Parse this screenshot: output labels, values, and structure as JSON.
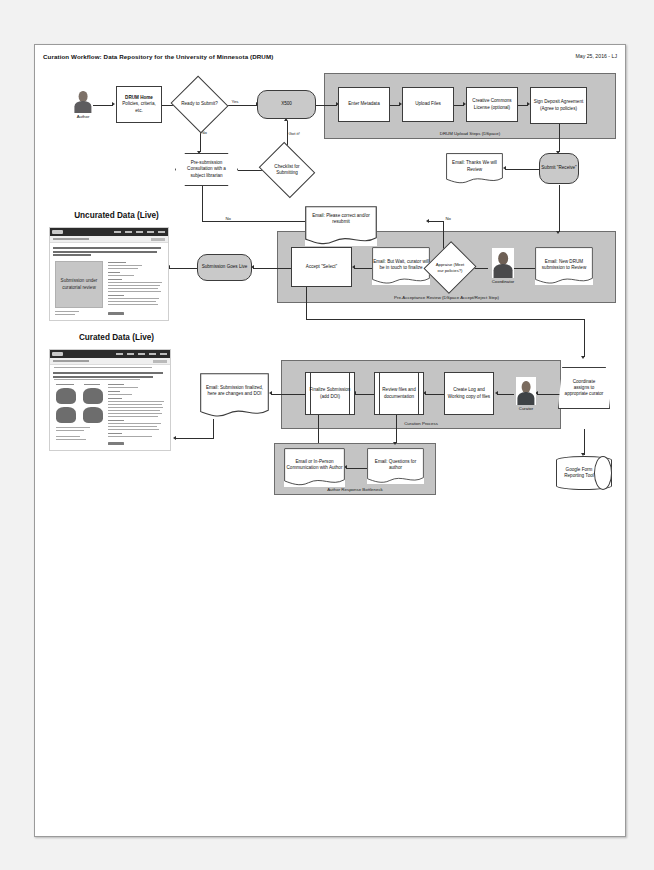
{
  "header": {
    "title": "Curation Workflow: Data Repository for the University of Minnesota (DRUM)",
    "date": "May 25, 2016 - LJ"
  },
  "actors": {
    "author": "Author",
    "coordinator": "Coordinator",
    "curator": "Curator"
  },
  "nodes": {
    "drum_home": "DRUM Home\nPolicies, criteria, etc.",
    "drum_home_l1": "DRUM Home",
    "drum_home_l2": "Policies, criteria, etc.",
    "ready_to_submit": "Ready to Submit?",
    "x500": "X500",
    "presubmission": "Pre-submission Consultation with a subject librarian",
    "checklist": "Checklist for Submitting",
    "enter_metadata": "Enter Metadata",
    "upload_files": "Upload Files",
    "cc_license": "Creative Commons License (optional)",
    "sign_deposit": "Sign Deposit Agreement (Agree to policies)",
    "email_thanks": "Email: Thanks We will Review",
    "submit_receive": "Submit \"Receive\"",
    "email_correct": "Email: Please correct and/or resubmit",
    "accept_select": "Accept \"Select\"",
    "email_but_wait": "Email: But Wait, curator will be in touch to finalize",
    "appraise": "Appraise (Meet our policies?)",
    "email_new_drum": "Email: New DRUM submission to Review",
    "submission_goes_live": "Submission Goes Live",
    "email_finalized": "Email: Submission finalized, here are changes and DOI",
    "finalize_submission": "Finalize Submission (add DOI)",
    "review_files": "Review files and documentation",
    "create_log": "Create Log and Working copy of files",
    "coordinate_assigns": "Coordinate assigns to appropriate curator",
    "google_form": "Google Form Reporting Tool",
    "email_in_person": "Email or In-Person Communication with Author",
    "email_questions": "Email: Questions for author"
  },
  "groups": {
    "upload_steps": "DRUM Upload Steps (DSpace)",
    "pre_acceptance": "Pre-Acceptance Review (DSpace Accept/Reject Step)",
    "curation_process": "Curation Process",
    "author_bottleneck": "Author Response Bottleneck"
  },
  "edge_labels": {
    "yes_submit": "Yes",
    "no_submit": "No",
    "got_it": "Got it!",
    "no_left": "No",
    "no_right": "No",
    "yes_appraise": "Yes"
  },
  "screenshots": {
    "uncurated_title": "Uncurated Data (Live)",
    "curated_title": "Curated Data (Live)",
    "uncurated_placeholder": "Submission under curatorial review"
  },
  "colors": {
    "group_fill": "#c4c4c4",
    "process_fill": "#c9c9c9",
    "stroke": "#3c3c3c",
    "canvas": "#ffffff"
  }
}
